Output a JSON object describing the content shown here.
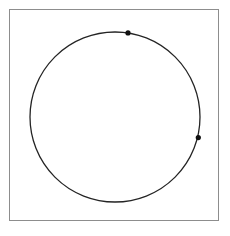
{
  "figure": {
    "type": "node-link-diagram",
    "background_color": "#ffffff",
    "frame": {
      "name": "figure-border",
      "x": 9,
      "y": 9,
      "width": 210,
      "height": 212,
      "stroke_color": "#8d8d8d",
      "stroke_width": 1,
      "fill": "#ffffff"
    },
    "circle": {
      "name": "boundary-circle",
      "cx": 115,
      "cy": 117,
      "r": 85,
      "stroke_color": "#242424",
      "stroke_width": 1.3,
      "fill": "none"
    },
    "arrow_head": {
      "length": 7,
      "half_width": 2.6,
      "style": "open-v"
    },
    "vertices": [
      {
        "id": "hub-top",
        "label": "top hub",
        "cx": 128,
        "cy": 32.9,
        "r": 2.6,
        "color": "#111111",
        "is_hub": true
      },
      {
        "id": "hub-right",
        "label": "right hub",
        "cx": 198.3,
        "cy": 137.6,
        "r": 2.6,
        "color": "#111111",
        "is_hub": true
      }
    ],
    "edges": [
      {
        "id": "e1",
        "from": "hub-top",
        "to_x": 36.5,
        "to_y": 86.0,
        "color": "#8a8a8a",
        "width": 0.85
      },
      {
        "id": "e2",
        "from": "hub-top",
        "to_x": 31.5,
        "to_y": 104.0,
        "color": "#4c4c4c",
        "width": 1.0
      },
      {
        "id": "e3",
        "from": "hub-top",
        "to_x": 33.5,
        "to_y": 143.0,
        "color": "#6b6b6b",
        "width": 0.95
      },
      {
        "id": "e4",
        "from": "hub-top",
        "to_x": 44.0,
        "to_y": 168.0,
        "color": "#7a7a7a",
        "width": 0.9
      },
      {
        "id": "e5",
        "from": "hub-top",
        "to_x": 61.0,
        "to_y": 186.0,
        "color": "#3c3c3c",
        "width": 1.05
      },
      {
        "id": "e6",
        "from": "hub-top",
        "to_x": 92.0,
        "to_y": 199.5,
        "color": "#3c3c3c",
        "width": 1.05
      },
      {
        "id": "e7",
        "from": "hub-top",
        "to_x": 110.0,
        "to_y": 201.5,
        "color": "#2e2e2e",
        "width": 1.1
      },
      {
        "id": "e8",
        "from": "hub-top",
        "to_x": 135.5,
        "to_y": 199.5,
        "color": "#2e2e2e",
        "width": 1.1
      },
      {
        "id": "e9",
        "from": "hub-top",
        "to_x": 167.0,
        "to_y": 180.0,
        "color": "#3c3c3c",
        "width": 1.05
      },
      {
        "id": "e10",
        "from": "hub-right",
        "to_x": 31.0,
        "to_y": 114.5,
        "color": "#6b6b6b",
        "width": 0.9
      },
      {
        "id": "e11",
        "from": "hub-right",
        "to_x": 36.0,
        "to_y": 152.0,
        "color": "#8a8a8a",
        "width": 0.85
      },
      {
        "id": "e12",
        "from": "hub-right",
        "to_x": 53.0,
        "to_y": 178.0,
        "color": "#8a8a8a",
        "width": 0.85
      },
      {
        "id": "e13",
        "from": "hub-right",
        "to_x": 78.0,
        "to_y": 194.0,
        "color": "#8a8a8a",
        "width": 0.85
      },
      {
        "id": "e14",
        "from": "hub-right",
        "to_x": 122.0,
        "to_y": 201.8,
        "color": "#6b6b6b",
        "width": 0.9
      },
      {
        "id": "e15",
        "from": "hub-right",
        "to_x": 151.0,
        "to_y": 193.0,
        "color": "#6b6b6b",
        "width": 0.9
      },
      {
        "id": "e16",
        "from": "hub-right",
        "to_x": 176.0,
        "to_y": 172.0,
        "color": "#6b6b6b",
        "width": 0.9
      },
      {
        "id": "e17",
        "from": "hub-right",
        "to_x": 128.0,
        "to_y": 32.9,
        "color": "#7a7a7a",
        "width": 0.9
      }
    ]
  }
}
